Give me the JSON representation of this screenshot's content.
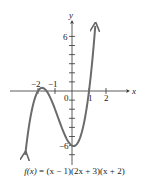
{
  "chart_data": {
    "type": "line",
    "title": "",
    "function": "f(x) = (x − 1)(2x + 3)(x + 2)",
    "xlabel": "x",
    "ylabel": "y",
    "x_ticks": [
      -2,
      -1,
      1,
      2
    ],
    "x_tick_labels": [
      "−2",
      "−1",
      "1",
      "2"
    ],
    "origin_label": "0",
    "y_tick_labels": [
      "6",
      "−6"
    ],
    "y_ticks": [
      -7,
      -6,
      -5,
      -4,
      -3,
      -2,
      -1,
      1,
      2,
      3,
      4,
      5,
      6
    ],
    "xlim": [
      -3.6,
      3.2
    ],
    "ylim": [
      -8.5,
      9.5
    ],
    "grid": false,
    "series": [
      {
        "name": "f(x)",
        "x": [
          -2.75,
          -2.5,
          -2.25,
          -2.0,
          -1.75,
          -1.5,
          -1.25,
          -1.0,
          -0.75,
          -0.5,
          -0.25,
          0.0,
          0.25,
          0.5,
          0.75,
          1.0,
          1.25,
          1.37
        ],
        "values": [
          -7.03,
          -3.5,
          -0.94,
          0.0,
          0.69,
          0.0,
          -0.56,
          -2.0,
          -3.5,
          -4.5,
          -5.44,
          -6.0,
          -6.27,
          -6.25,
          -4.55,
          0.0,
          4.13,
          7.16
        ]
      }
    ],
    "zeros": [
      -2,
      -1.5,
      1
    ],
    "y_intercept": -6
  },
  "caption": {
    "fx": "f(x)",
    "eq": " = (x − 1)(2x + 3)(x + 2)"
  }
}
